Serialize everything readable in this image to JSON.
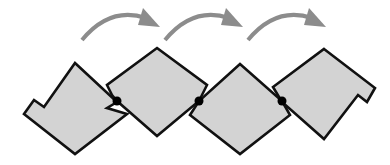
{
  "diagram": {
    "description": "Chain of four hinged tiles rotating in sequence",
    "colors": {
      "background": "#ffffff",
      "tile_fill": "#d3d3d3",
      "tile_stroke": "#111111",
      "hinge": "#000000",
      "arrow": "#8c8c8c"
    },
    "tiles": [
      {
        "id": "tile-1",
        "points": "75,63 117,102 107,108 127,114 75,154 24,114 34,100 44,107"
      },
      {
        "id": "tile-2",
        "points": "157,48 207,85 199,101 157,136 117,101 112,95 107,85"
      },
      {
        "id": "tile-3",
        "points": "240,64 282,101 290,115 240,154 190,115 199,101"
      },
      {
        "id": "tile-4",
        "points": "324,49 375,88 367,102 358,95 324,139 282,102 273,87"
      }
    ],
    "hinges": [
      {
        "id": "hinge-1",
        "cx": 117,
        "cy": 101
      },
      {
        "id": "hinge-2",
        "cx": 199,
        "cy": 101
      },
      {
        "id": "hinge-3",
        "cx": 282,
        "cy": 101
      }
    ],
    "arrows": [
      {
        "id": "arrow-1",
        "path": "M82,40 Q110,6 146,18",
        "head": "143,8 160,27 138,25"
      },
      {
        "id": "arrow-2",
        "path": "M165,40 Q193,6 229,18",
        "head": "226,8 243,27 221,25"
      },
      {
        "id": "arrow-3",
        "path": "M248,40 Q276,6 312,18",
        "head": "309,8 326,27 304,25"
      }
    ]
  }
}
